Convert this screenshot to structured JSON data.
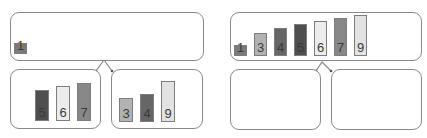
{
  "diagram": {
    "type": "merge-sort-step",
    "panels": [
      {
        "id": "before",
        "top": {
          "items": [
            {
              "value": "1",
              "height": 11,
              "color": "#7a7a7a"
            }
          ]
        },
        "left_child": {
          "items": [
            {
              "value": "5",
              "height": 31,
              "color": "#4f4f4f"
            },
            {
              "value": "6",
              "height": 35,
              "color": "#ececec"
            },
            {
              "value": "7",
              "height": 38,
              "color": "#888888"
            }
          ]
        },
        "right_child": {
          "items": [
            {
              "value": "3",
              "height": 24,
              "color": "#b2b2b2"
            },
            {
              "value": "4",
              "height": 28,
              "color": "#666666"
            },
            {
              "value": "9",
              "height": 41,
              "color": "#e2e2e2"
            }
          ]
        }
      },
      {
        "id": "after",
        "top": {
          "items": [
            {
              "value": "1",
              "height": 11,
              "color": "#7a7a7a"
            },
            {
              "value": "3",
              "height": 23,
              "color": "#b2b2b2"
            },
            {
              "value": "4",
              "height": 28,
              "color": "#666666"
            },
            {
              "value": "5",
              "height": 32,
              "color": "#4f4f4f"
            },
            {
              "value": "6",
              "height": 35,
              "color": "#ececec"
            },
            {
              "value": "7",
              "height": 38,
              "color": "#888888"
            },
            {
              "value": "9",
              "height": 41,
              "color": "#e2e2e2"
            }
          ]
        },
        "left_child": {
          "items": []
        },
        "right_child": {
          "items": []
        }
      }
    ]
  }
}
